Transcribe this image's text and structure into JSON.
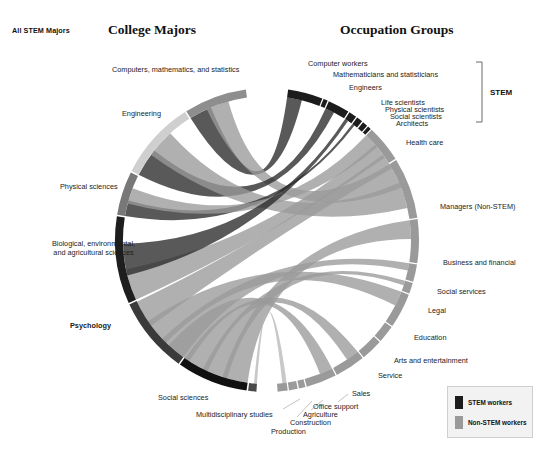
{
  "corner_tag": "All STEM Majors",
  "titles": {
    "left": "College Majors",
    "right": "Occupation Groups"
  },
  "bracket": {
    "label": "STEM"
  },
  "legend": {
    "items": [
      {
        "label": "STEM workers",
        "color": "#1c1c1c"
      },
      {
        "label": "Non-STEM workers",
        "color": "#9a9a9a"
      }
    ]
  },
  "chart_data": {
    "type": "chord",
    "title": "All STEM Majors",
    "left_axis_title": "College Majors",
    "right_axis_title": "Occupation Groups",
    "geometry": {
      "cx": 267,
      "cy": 240,
      "r_outer": 152,
      "r_inner": 144,
      "gap_deg": 3
    },
    "majors": [
      {
        "label": "Computers, mathematics, and statistics",
        "share": 11.5,
        "color": "#8e8e8e",
        "label_x": 112,
        "label_y": 66,
        "align": "left"
      },
      {
        "label": "Engineering",
        "share": 14.5,
        "color": "#cfcfcf",
        "label_x": 122,
        "label_y": 110,
        "align": "left"
      },
      {
        "label": "Physical sciences",
        "share": 8.0,
        "color": "#787878",
        "label_x": 60,
        "label_y": 183,
        "align": "left"
      },
      {
        "label": "Biological, environmental, and agricultural  sciences",
        "share": 16.0,
        "color": "#1e1e1e",
        "label_x": 46,
        "label_y": 240,
        "align": "center"
      },
      {
        "label": "Psychology",
        "share": 14.0,
        "color": "#3a3a3a",
        "bold": true,
        "label_x": 70,
        "label_y": 322,
        "align": "left"
      },
      {
        "label": "Social sciences",
        "share": 13.0,
        "color": "#111111",
        "label_x": 158,
        "label_y": 394,
        "align": "left"
      },
      {
        "label": "Multidisciplinary studies",
        "share": 1.5,
        "color": "#4a4a4a",
        "label_x": 196,
        "label_y": 411,
        "align": "left"
      }
    ],
    "occupations": [
      {
        "label": "Computer workers",
        "share": 8.0,
        "group": "STEM",
        "color": "#1c1c1c",
        "label_x": 308,
        "label_y": 60,
        "align": "left"
      },
      {
        "label": "Mathematicians and statisticians",
        "share": 1.0,
        "group": "STEM",
        "color": "#1c1c1c",
        "label_x": 333,
        "label_y": 71,
        "align": "left"
      },
      {
        "label": "Engineers",
        "share": 5.0,
        "group": "STEM",
        "color": "#1c1c1c",
        "label_x": 349,
        "label_y": 84,
        "align": "left"
      },
      {
        "label": "Life scientists",
        "share": 1.8,
        "group": "STEM",
        "color": "#1c1c1c",
        "label_x": 381,
        "label_y": 99,
        "align": "left"
      },
      {
        "label": "Physical scientists",
        "share": 1.4,
        "group": "STEM",
        "color": "#1c1c1c",
        "label_x": 385,
        "label_y": 106,
        "align": "left"
      },
      {
        "label": "Social scientists",
        "share": 1.2,
        "group": "STEM",
        "color": "#1c1c1c",
        "label_x": 390,
        "label_y": 113,
        "align": "left"
      },
      {
        "label": "Architects",
        "share": 0.8,
        "group": "STEM",
        "color": "#1c1c1c",
        "label_x": 396,
        "label_y": 120,
        "align": "left"
      },
      {
        "label": "Health care",
        "share": 8.5,
        "group": "Non-STEM",
        "color": "#9a9a9a",
        "label_x": 406,
        "label_y": 139,
        "align": "left"
      },
      {
        "label": "Managers (Non-STEM)",
        "share": 14.0,
        "group": "Non-STEM",
        "color": "#9a9a9a",
        "label_x": 440,
        "label_y": 203,
        "align": "left"
      },
      {
        "label": "Business and financial",
        "share": 10.0,
        "group": "Non-STEM",
        "color": "#9a9a9a",
        "label_x": 443,
        "label_y": 259,
        "align": "left"
      },
      {
        "label": "Social services",
        "share": 4.0,
        "group": "Non-STEM",
        "color": "#9a9a9a",
        "label_x": 437,
        "label_y": 288,
        "align": "left"
      },
      {
        "label": "Legal",
        "share": 2.5,
        "group": "Non-STEM",
        "color": "#9a9a9a",
        "label_x": 428,
        "label_y": 307,
        "align": "left"
      },
      {
        "label": "Education",
        "share": 8.0,
        "group": "Non-STEM",
        "color": "#9a9a9a",
        "label_x": 414,
        "label_y": 334,
        "align": "left"
      },
      {
        "label": "Arts and entertainment",
        "share": 4.0,
        "group": "Non-STEM",
        "color": "#9a9a9a",
        "label_x": 394,
        "label_y": 357,
        "align": "left"
      },
      {
        "label": "Service",
        "share": 5.0,
        "group": "Non-STEM",
        "color": "#9a9a9a",
        "label_x": 378,
        "label_y": 372,
        "align": "left"
      },
      {
        "label": "Sales",
        "share": 7.0,
        "group": "Non-STEM",
        "color": "#9a9a9a",
        "label_x": 352,
        "label_y": 390,
        "align": "left"
      },
      {
        "label": "Office support",
        "share": 7.0,
        "group": "Non-STEM",
        "color": "#9a9a9a",
        "label_x": 313,
        "label_y": 403,
        "align": "left"
      },
      {
        "label": "Agriculture",
        "share": 1.5,
        "group": "Non-STEM",
        "color": "#9a9a9a",
        "label_x": 303,
        "label_y": 411,
        "align": "left"
      },
      {
        "label": "Construction",
        "share": 2.0,
        "group": "Non-STEM",
        "color": "#9a9a9a",
        "label_x": 290,
        "label_y": 419,
        "align": "left"
      },
      {
        "label": "Production",
        "share": 2.3,
        "group": "Non-STEM",
        "color": "#9a9a9a",
        "label_x": 271,
        "label_y": 428,
        "align": "left"
      }
    ],
    "flows": [
      {
        "from": "Computers, mathematics, and statistics",
        "to": "Computer workers",
        "value": 4.2,
        "color": "#2a2a2a"
      },
      {
        "from": "Computers, mathematics, and statistics",
        "to": "Managers (Non-STEM)",
        "value": 2.0,
        "color": "#9a9a9a"
      },
      {
        "from": "Engineering",
        "to": "Engineers",
        "value": 3.6,
        "color": "#2a2a2a"
      },
      {
        "from": "Engineering",
        "to": "Managers (Non-STEM)",
        "value": 2.4,
        "color": "#9a9a9a"
      },
      {
        "from": "Physical sciences",
        "to": "Physical scientists",
        "value": 1.0,
        "color": "#2a2a2a"
      },
      {
        "from": "Physical sciences",
        "to": "Health care",
        "value": 1.4,
        "color": "#9a9a9a"
      },
      {
        "from": "Biological, environmental, and agricultural  sciences",
        "to": "Health care",
        "value": 3.4,
        "color": "#9a9a9a"
      },
      {
        "from": "Biological, environmental, and agricultural  sciences",
        "to": "Life scientists",
        "value": 1.2,
        "color": "#2a2a2a"
      },
      {
        "from": "Psychology",
        "to": "Social services",
        "value": 2.2,
        "color": "#9a9a9a"
      },
      {
        "from": "Psychology",
        "to": "Education",
        "value": 2.6,
        "color": "#9a9a9a"
      },
      {
        "from": "Psychology",
        "to": "Health care",
        "value": 2.2,
        "color": "#9a9a9a"
      },
      {
        "from": "Social sciences",
        "to": "Business and financial",
        "value": 2.8,
        "color": "#9a9a9a"
      },
      {
        "from": "Social sciences",
        "to": "Legal",
        "value": 1.6,
        "color": "#9a9a9a"
      },
      {
        "from": "Social sciences",
        "to": "Sales",
        "value": 2.4,
        "color": "#9a9a9a"
      },
      {
        "from": "Social sciences",
        "to": "Office support",
        "value": 2.2,
        "color": "#9a9a9a"
      },
      {
        "from": "Multidisciplinary studies",
        "to": "Production",
        "value": 0.6,
        "color": "#b8b8b8"
      }
    ]
  }
}
